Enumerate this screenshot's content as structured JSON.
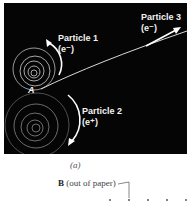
{
  "figure": {
    "particles": [
      {
        "name": "Particle 1",
        "charge": "(e⁻)"
      },
      {
        "name": "Particle 2",
        "charge": "(e⁺)"
      },
      {
        "name": "Particle 3",
        "charge": "(e⁻)"
      }
    ],
    "point_label": "A",
    "caption": "(a)",
    "field_symbol": "B",
    "field_text": "(out of paper)"
  }
}
